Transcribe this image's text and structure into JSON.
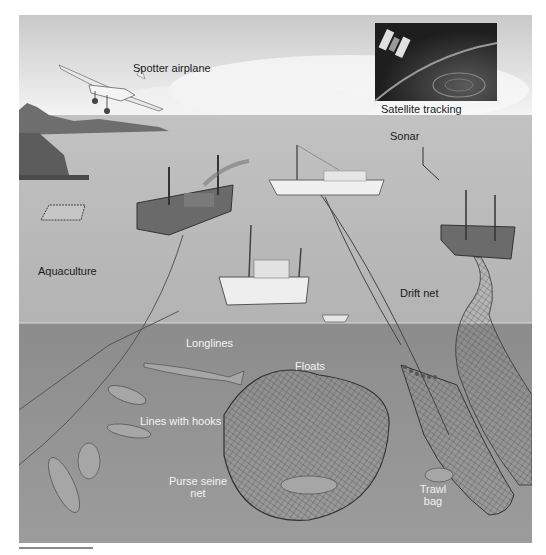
{
  "figure": {
    "labels": {
      "spotter_airplane": "Spotter airplane",
      "satellite_tracking": "Satellite tracking",
      "sonar": "Sonar",
      "aquaculture": "Aquaculture",
      "drift_net": "Drift net",
      "longlines": "Longlines",
      "floats": "Floats",
      "lines_with_hooks": "Lines with hooks",
      "purse_seine_net_line1": "Purse seine",
      "purse_seine_net_line2": "net",
      "trawl_bag_line1": "Trawl",
      "trawl_bag_line2": "bag"
    },
    "colors": {
      "sky_top": "#c9c9c9",
      "sky_bottom": "#f4f4f4",
      "sea_surface": "#b9b9b9",
      "underwater": "#8f8f8f",
      "underwater_deep": "#9a9a9a",
      "satellite_panel": "#2a2a2a",
      "label_dark": "#1a1a1a",
      "label_light": "#f2f2f2"
    }
  }
}
